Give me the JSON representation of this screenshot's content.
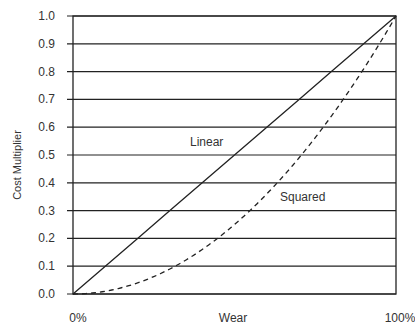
{
  "chart_data": {
    "type": "line",
    "title": "",
    "xlabel": "Wear",
    "ylabel": "Cost Multiplier",
    "x_tick_labels": [
      "0%",
      "100%"
    ],
    "y_tick_labels": [
      "0.0",
      "0.1",
      "0.2",
      "0.3",
      "0.4",
      "0.5",
      "0.6",
      "0.7",
      "0.8",
      "0.9",
      "1.0"
    ],
    "ylim": [
      0,
      1.0
    ],
    "xlim": [
      0,
      1.0
    ],
    "grid": "horizontal",
    "legend": "inline annotations",
    "x": [
      0,
      0.1,
      0.2,
      0.3,
      0.4,
      0.5,
      0.6,
      0.7,
      0.8,
      0.9,
      1.0
    ],
    "series": [
      {
        "name": "Linear",
        "style": "solid",
        "values": [
          0,
          0.1,
          0.2,
          0.3,
          0.4,
          0.5,
          0.6,
          0.7,
          0.8,
          0.9,
          1.0
        ]
      },
      {
        "name": "Squared",
        "style": "dashed",
        "values": [
          0,
          0.01,
          0.04,
          0.09,
          0.16,
          0.25,
          0.36,
          0.49,
          0.64,
          0.81,
          1.0
        ]
      }
    ],
    "annotations": [
      {
        "text": "Linear",
        "x": 0.37,
        "y": 0.55
      },
      {
        "text": "Squared",
        "x": 0.65,
        "y": 0.35
      }
    ]
  }
}
